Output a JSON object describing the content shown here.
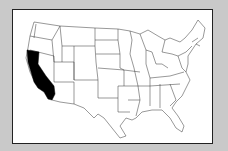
{
  "map": {
    "type": "us-states-outline",
    "highlighted_state": "California",
    "highlight_color": "#000000",
    "background_color": "#c9c9c9",
    "frame_color": "#ffffff",
    "border_color": "#222222"
  }
}
